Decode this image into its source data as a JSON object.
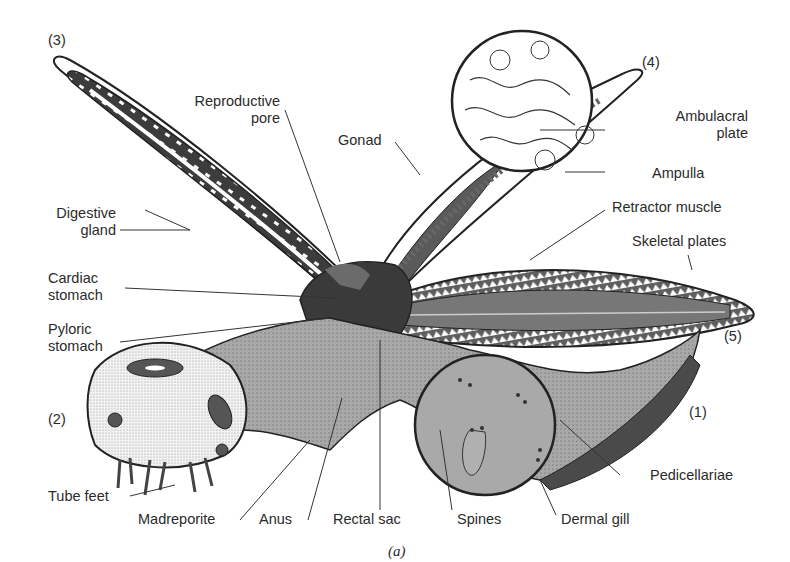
{
  "figure": {
    "caption": "(a)",
    "arm_numbers": [
      "(1)",
      "(2)",
      "(3)",
      "(4)",
      "(5)"
    ],
    "labels": {
      "reproductive_pore": [
        "Reproductive",
        "pore"
      ],
      "gonad": "Gonad",
      "ambulacral_plate": [
        "Ambulacral",
        "plate"
      ],
      "ampulla": "Ampulla",
      "retractor_muscle": "Retractor muscle",
      "skeletal_plates": "Skeletal plates",
      "digestive_gland": [
        "Digestive",
        "gland"
      ],
      "cardiac_stomach": [
        "Cardiac",
        "stomach"
      ],
      "pyloric_stomach": [
        "Pyloric",
        "stomach"
      ],
      "tube_feet": "Tube feet",
      "madreporite": "Madreporite",
      "anus": "Anus",
      "rectal_sac": "Rectal sac",
      "spines": "Spines",
      "dermal_gill": "Dermal gill",
      "pedicellariae": "Pedicellariae"
    },
    "colors": {
      "dark_tissue": "#3a3a3a",
      "mid_tissue": "#6b6b6b",
      "body_wall": "#a9a9a9",
      "outline": "#222222",
      "background": "#ffffff"
    }
  }
}
